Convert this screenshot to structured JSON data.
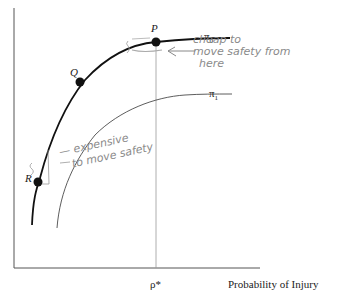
{
  "diagram": {
    "type": "production-possibility-frontier",
    "xlabel": "Probability of Injury",
    "x_marker": "ρ*",
    "curves": [
      {
        "name": "π",
        "sub": "0",
        "style": "bold"
      },
      {
        "name": "π",
        "sub": "1",
        "style": "thin"
      }
    ],
    "points": [
      {
        "label": "P"
      },
      {
        "label": "Q"
      },
      {
        "label": "R"
      }
    ],
    "annotations": {
      "near_p": [
        "cheap  to",
        "move  safety  from",
        "here"
      ],
      "near_r": [
        "— expensive",
        "to move safety"
      ]
    },
    "colors": {
      "ink": "#111111",
      "axis": "#555555",
      "thin_curve": "#333333",
      "dotted": "#9a9a9a",
      "handwriting": "#8a8a8a"
    }
  }
}
